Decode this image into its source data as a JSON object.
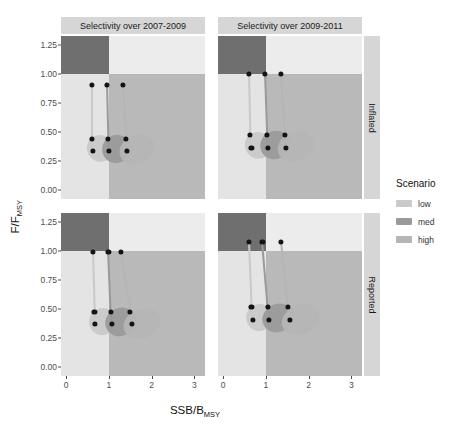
{
  "axes": {
    "ylabel_main": "F",
    "ylabel_sep": "/",
    "ylabel_num": "F",
    "ylabel_sub": "MSY",
    "xlabel_num": "SSB",
    "xlabel_sep": "/",
    "xlabel_den": "B",
    "xlabel_sub": "MSY"
  },
  "legend": {
    "title": "Scenario",
    "items": [
      {
        "label": "low",
        "color": "#c9c9c9"
      },
      {
        "label": "med",
        "color": "#9a9a9a"
      },
      {
        "label": "high",
        "color": "#b5b5b5"
      }
    ]
  },
  "facets": {
    "columns": [
      "Selectivity over 2007-2009",
      "Selectivity over 2009-2011"
    ],
    "rows": [
      "Inflated",
      "Reported"
    ]
  },
  "chart_data": {
    "type": "scatter",
    "title": "",
    "xlabel": "SSB/BMSY",
    "ylabel": "F/FMSY",
    "xlim": [
      -0.12,
      3.25
    ],
    "ylim": [
      -0.08,
      1.33
    ],
    "xticks": [
      0,
      1,
      2,
      3
    ],
    "yticks": [
      0.0,
      0.25,
      0.5,
      0.75,
      1.0,
      1.25
    ],
    "xtick_labels": [
      "0",
      "1",
      "2",
      "3"
    ],
    "ytick_labels": [
      "0.00",
      "0.25",
      "0.50",
      "0.75",
      "1.00",
      "1.25"
    ],
    "grid": false,
    "legend_position": "right",
    "reference_lines": {
      "x": 1.0,
      "y": 1.0
    },
    "quadrant_colors": {
      "upper_left": "#6f6f6f",
      "upper_right": "#ececec",
      "lower_left": "#e4e4e4",
      "lower_right": "#b9b9b9"
    },
    "panels": [
      {
        "column": "Selectivity over 2007-2009",
        "row": "Inflated",
        "series": [
          {
            "name": "low",
            "color": "#c9c9c9",
            "points": [
              [
                0.6,
                0.91
              ],
              [
                0.6,
                0.44
              ],
              [
                0.62,
                0.335
              ]
            ],
            "cloud": {
              "cx": 0.78,
              "cy": 0.355,
              "rx": 0.3,
              "ry": 0.115,
              "rot": -30
            }
          },
          {
            "name": "med",
            "color": "#9a9a9a",
            "points": [
              [
                0.95,
                0.91
              ],
              [
                0.98,
                0.44
              ],
              [
                1.0,
                0.335
              ]
            ],
            "cloud": {
              "cx": 1.18,
              "cy": 0.355,
              "rx": 0.34,
              "ry": 0.12,
              "rot": -28
            }
          },
          {
            "name": "high",
            "color": "#b5b5b5",
            "points": [
              [
                1.32,
                0.91
              ],
              [
                1.4,
                0.44
              ],
              [
                1.43,
                0.335
              ]
            ],
            "cloud": {
              "cx": 1.66,
              "cy": 0.345,
              "rx": 0.42,
              "ry": 0.125,
              "rot": -24
            }
          }
        ]
      },
      {
        "column": "Selectivity over 2009-2011",
        "row": "Inflated",
        "series": [
          {
            "name": "low",
            "color": "#c9c9c9",
            "points": [
              [
                0.6,
                1.0
              ],
              [
                0.63,
                0.475
              ],
              [
                0.66,
                0.365
              ]
            ],
            "cloud": {
              "cx": 0.82,
              "cy": 0.385,
              "rx": 0.3,
              "ry": 0.115,
              "rot": -30
            }
          },
          {
            "name": "med",
            "color": "#9a9a9a",
            "points": [
              [
                0.97,
                1.0
              ],
              [
                1.02,
                0.475
              ],
              [
                1.05,
                0.365
              ]
            ],
            "cloud": {
              "cx": 1.22,
              "cy": 0.385,
              "rx": 0.35,
              "ry": 0.12,
              "rot": -27
            }
          },
          {
            "name": "high",
            "color": "#b5b5b5",
            "points": [
              [
                1.35,
                1.0
              ],
              [
                1.44,
                0.475
              ],
              [
                1.47,
                0.365
              ]
            ],
            "cloud": {
              "cx": 1.7,
              "cy": 0.375,
              "rx": 0.43,
              "ry": 0.125,
              "rot": -24
            }
          }
        ]
      },
      {
        "column": "Selectivity over 2007-2009",
        "row": "Reported",
        "series": [
          {
            "name": "low",
            "color": "#c9c9c9",
            "points": [
              [
                0.62,
                0.995
              ],
              [
                0.66,
                0.475
              ],
              [
                0.68,
                0.37
              ]
            ],
            "cloud": {
              "cx": 0.86,
              "cy": 0.39,
              "rx": 0.32,
              "ry": 0.115,
              "rot": -29
            }
          },
          {
            "name": "med",
            "color": "#9a9a9a",
            "points": [
              [
                0.99,
                0.995
              ],
              [
                1.05,
                0.475
              ],
              [
                1.07,
                0.37
              ]
            ],
            "cloud": {
              "cx": 1.27,
              "cy": 0.39,
              "rx": 0.36,
              "ry": 0.12,
              "rot": -26
            }
          },
          {
            "name": "high",
            "color": "#b5b5b5",
            "points": [
              [
                1.28,
                0.99
              ],
              [
                1.5,
                0.475
              ],
              [
                1.54,
                0.37
              ]
            ],
            "cloud": {
              "cx": 1.78,
              "cy": 0.375,
              "rx": 0.45,
              "ry": 0.125,
              "rot": -22
            }
          }
        ]
      },
      {
        "column": "Selectivity over 2009-2011",
        "row": "Reported",
        "series": [
          {
            "name": "low",
            "color": "#c9c9c9",
            "points": [
              [
                0.6,
                1.08
              ],
              [
                0.66,
                0.515
              ],
              [
                0.69,
                0.405
              ]
            ],
            "cloud": {
              "cx": 0.86,
              "cy": 0.425,
              "rx": 0.32,
              "ry": 0.115,
              "rot": -29
            }
          },
          {
            "name": "med",
            "color": "#9a9a9a",
            "points": [
              [
                0.92,
                1.08
              ],
              [
                1.05,
                0.515
              ],
              [
                1.08,
                0.405
              ]
            ],
            "cloud": {
              "cx": 1.28,
              "cy": 0.425,
              "rx": 0.37,
              "ry": 0.12,
              "rot": -26
            }
          },
          {
            "name": "high",
            "color": "#b5b5b5",
            "points": [
              [
                1.36,
                1.08
              ],
              [
                1.52,
                0.515
              ],
              [
                1.56,
                0.405
              ]
            ],
            "cloud": {
              "cx": 1.82,
              "cy": 0.41,
              "rx": 0.46,
              "ry": 0.125,
              "rot": -22
            }
          }
        ]
      }
    ]
  }
}
